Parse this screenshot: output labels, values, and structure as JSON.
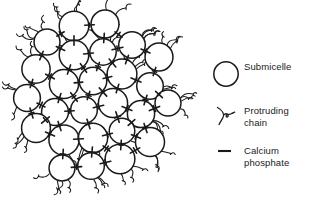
{
  "figure": {
    "ink_color": "#1a1a1a",
    "background_color": "#ffffff"
  },
  "diagram": {
    "name": "casein-micelle",
    "submicelle_count": 26,
    "submicelle_radius": 14.5,
    "submicelle_centers": [
      [
        74,
        26
      ],
      [
        105,
        24
      ],
      [
        47,
        42
      ],
      [
        74,
        55
      ],
      [
        103,
        52
      ],
      [
        132,
        45
      ],
      [
        159,
        57
      ],
      [
        36,
        69
      ],
      [
        64,
        84
      ],
      [
        93,
        81
      ],
      [
        122,
        74
      ],
      [
        150,
        86
      ],
      [
        27,
        98
      ],
      [
        55,
        112
      ],
      [
        84,
        110
      ],
      [
        113,
        103
      ],
      [
        141,
        114
      ],
      [
        168,
        103
      ],
      [
        36,
        128
      ],
      [
        64,
        140
      ],
      [
        93,
        138
      ],
      [
        122,
        131
      ],
      [
        150,
        142
      ],
      [
        62,
        168
      ],
      [
        91,
        166
      ],
      [
        120,
        159
      ]
    ],
    "protruding_chain_count": 44,
    "calcium_phosphate_link_count": 48
  },
  "legend": {
    "name": "legend",
    "items": [
      {
        "symbol": "circle-outline",
        "label": "Submicelle"
      },
      {
        "symbol": "protruding-chain-squiggle",
        "label": "Protruding\nchain"
      },
      {
        "symbol": "short-dash",
        "label": "Calcium\nphosphate"
      }
    ]
  }
}
